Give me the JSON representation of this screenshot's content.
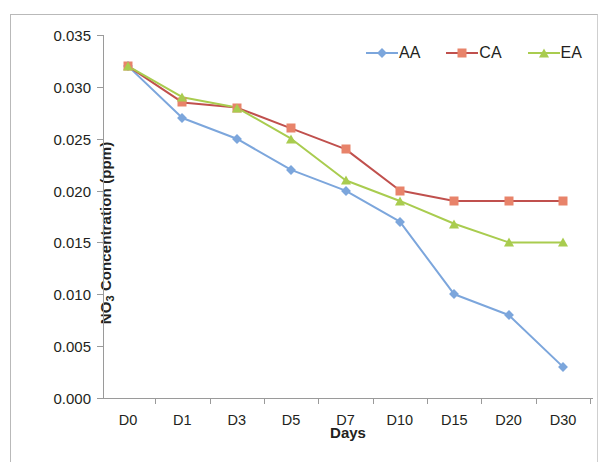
{
  "figure": {
    "background_color": "#ffffff",
    "border_color": "#b9b9b9"
  },
  "chart_data": {
    "type": "line",
    "title": "",
    "subtitle": "",
    "xlabel": "Days",
    "ylabel": "NO3 Concentration (ppm)",
    "ylabel_parts": {
      "prefix": "NO",
      "subscript": "3",
      "suffix": " Concentration (ppm)"
    },
    "categories": [
      "D0",
      "D1",
      "D3",
      "D5",
      "D7",
      "D10",
      "D15",
      "D20",
      "D30"
    ],
    "ylim": [
      0.0,
      0.035
    ],
    "ytick_step": 0.005,
    "ytick_labels": [
      "0.000",
      "0.005",
      "0.010",
      "0.015",
      "0.020",
      "0.025",
      "0.030",
      "0.035"
    ],
    "ytick_values": [
      0.0,
      0.005,
      0.01,
      0.015,
      0.02,
      0.025,
      0.03,
      0.035
    ],
    "grid": false,
    "legend_position": "top-right",
    "series": [
      {
        "name": "AA",
        "color": "#7CA6DC",
        "marker": "diamond",
        "marker_color": "#7CA6DC",
        "values": [
          0.032,
          0.027,
          0.025,
          0.022,
          0.02,
          0.017,
          0.01,
          0.008,
          0.003
        ]
      },
      {
        "name": "CA",
        "color": "#C0504D",
        "marker": "square",
        "marker_color": "#E8836A",
        "values": [
          0.032,
          0.0285,
          0.028,
          0.026,
          0.024,
          0.02,
          0.019,
          0.019,
          0.019
        ]
      },
      {
        "name": "EA",
        "color": "#A9CC4F",
        "marker": "triangle",
        "marker_color": "#A9CC4F",
        "values": [
          0.032,
          0.029,
          0.028,
          0.025,
          0.021,
          0.019,
          0.0168,
          0.015,
          0.015
        ]
      }
    ]
  },
  "legend": {
    "items": [
      {
        "label": "AA"
      },
      {
        "label": "CA"
      },
      {
        "label": "EA"
      }
    ]
  }
}
